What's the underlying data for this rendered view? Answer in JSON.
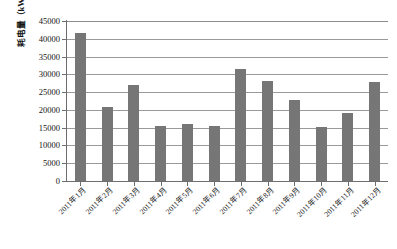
{
  "chart_data": {
    "type": "bar",
    "title": "",
    "xlabel": "",
    "ylabel": "耗电量（kWh）",
    "ylim": [
      0,
      45000
    ],
    "ytick_interval": 5000,
    "yticks": [
      45000,
      40000,
      35000,
      30000,
      25000,
      20000,
      15000,
      10000,
      5000,
      0
    ],
    "ytick_labels": [
      "45000",
      "40000",
      "35000",
      "30000",
      "25000",
      "20000",
      "15000",
      "10000",
      "5000",
      "0"
    ],
    "grid": true,
    "legend": null,
    "bar_color": "#767676",
    "gridline_color": "#9a9a9a",
    "axis_color": "#6e6e6e",
    "categories": [
      "2011年1月",
      "2011年2月",
      "2011年3月",
      "2011年4月",
      "2011年5月",
      "2011年6月",
      "2011年7月",
      "2011年8月",
      "2011年9月",
      "2011年10月",
      "2011年11月",
      "2011年12月"
    ],
    "values": [
      41500,
      20900,
      27100,
      15400,
      16000,
      15400,
      31400,
      28000,
      22700,
      15100,
      19200,
      27800
    ],
    "series": [
      {
        "name": "耗电量",
        "values": [
          41500,
          20900,
          27100,
          15400,
          16000,
          15400,
          31400,
          28000,
          22700,
          15100,
          19200,
          27800
        ]
      }
    ]
  },
  "caption": {
    "text": ""
  }
}
